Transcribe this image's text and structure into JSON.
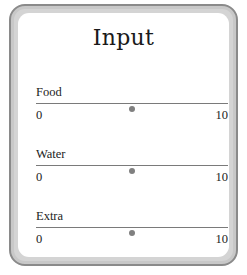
{
  "panel": {
    "title": "Input"
  },
  "sliders": [
    {
      "label": "Food",
      "min": "0",
      "max": "10",
      "value": 5
    },
    {
      "label": "Water",
      "min": "0",
      "max": "10",
      "value": 5
    },
    {
      "label": "Extra",
      "min": "0",
      "max": "10",
      "value": 5
    }
  ],
  "colors": {
    "frame_outer": "#8a8a8a",
    "frame_inner": "#d4d4d4",
    "track": "#7a7a7a",
    "thumb": "#808080"
  }
}
